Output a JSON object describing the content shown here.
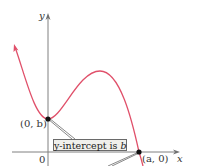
{
  "diagram": {
    "type": "function-graph",
    "axes": {
      "x_label": "x",
      "y_label": "y",
      "origin_label": "0"
    },
    "points": {
      "y_intercept_label": "(0, b)",
      "x_intercept_label": "(a, 0)"
    },
    "callout": {
      "text_prefix": "y-intercept is ",
      "text_var": "b"
    },
    "colors": {
      "curve": "#e0506a",
      "axis": "#707070",
      "point": "#111111",
      "callout_bg": "#f0f0ec"
    }
  }
}
